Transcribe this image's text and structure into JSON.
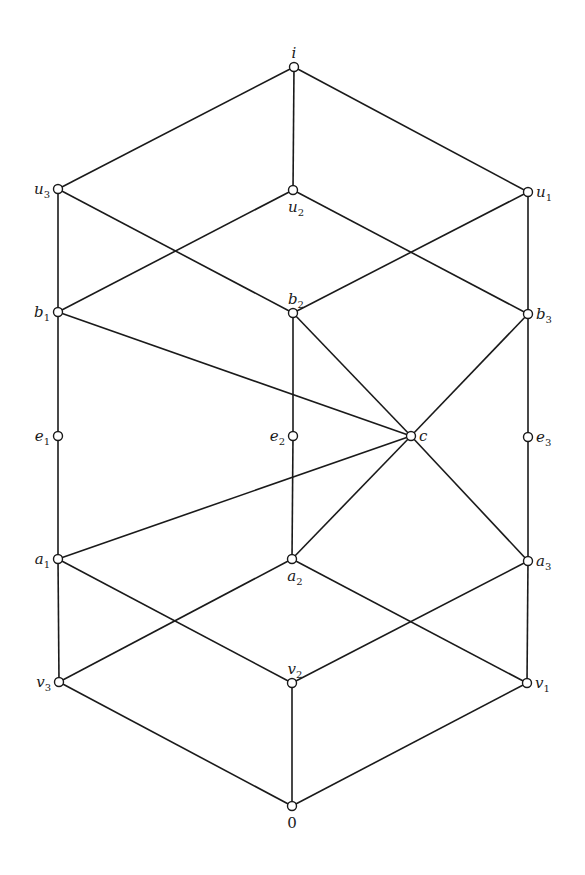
{
  "diagram": {
    "type": "hasse-diagram",
    "style": {
      "line_color": "#1a1a1a",
      "node_fill": "#ffffff",
      "background": "#ffffff"
    },
    "nodes": [
      {
        "id": "i",
        "base": "i",
        "sub": "",
        "x": 294,
        "y": 67,
        "label_pos": "above"
      },
      {
        "id": "u3",
        "base": "u",
        "sub": "3",
        "x": 58,
        "y": 189,
        "label_pos": "left"
      },
      {
        "id": "u2",
        "base": "u",
        "sub": "2",
        "x": 293,
        "y": 190,
        "label_pos": "below"
      },
      {
        "id": "u1",
        "base": "u",
        "sub": "1",
        "x": 528,
        "y": 192,
        "label_pos": "right"
      },
      {
        "id": "b1",
        "base": "b",
        "sub": "1",
        "x": 58,
        "y": 312,
        "label_pos": "left"
      },
      {
        "id": "b2",
        "base": "b",
        "sub": "2",
        "x": 293,
        "y": 313,
        "label_pos": "above"
      },
      {
        "id": "b3",
        "base": "b",
        "sub": "3",
        "x": 528,
        "y": 314,
        "label_pos": "right"
      },
      {
        "id": "e1",
        "base": "e",
        "sub": "1",
        "x": 58,
        "y": 436,
        "label_pos": "left"
      },
      {
        "id": "e2",
        "base": "e",
        "sub": "2",
        "x": 293,
        "y": 436,
        "label_pos": "left"
      },
      {
        "id": "c",
        "base": "c",
        "sub": "",
        "x": 411,
        "y": 436,
        "label_pos": "right"
      },
      {
        "id": "e3",
        "base": "e",
        "sub": "3",
        "x": 528,
        "y": 437,
        "label_pos": "right"
      },
      {
        "id": "a1",
        "base": "a",
        "sub": "1",
        "x": 58,
        "y": 559,
        "label_pos": "left"
      },
      {
        "id": "a2",
        "base": "a",
        "sub": "2",
        "x": 292,
        "y": 559,
        "label_pos": "below"
      },
      {
        "id": "a3",
        "base": "a",
        "sub": "3",
        "x": 528,
        "y": 561,
        "label_pos": "right"
      },
      {
        "id": "v3",
        "base": "v",
        "sub": "3",
        "x": 59,
        "y": 682,
        "label_pos": "left"
      },
      {
        "id": "v2",
        "base": "v",
        "sub": "2",
        "x": 292,
        "y": 683,
        "label_pos": "above"
      },
      {
        "id": "v1",
        "base": "v",
        "sub": "1",
        "x": 527,
        "y": 683,
        "label_pos": "right"
      },
      {
        "id": "0",
        "base": "0",
        "sub": "",
        "x": 292,
        "y": 806,
        "label_pos": "below",
        "upright": true
      }
    ],
    "edges": [
      [
        "i",
        "u3"
      ],
      [
        "i",
        "u2"
      ],
      [
        "i",
        "u1"
      ],
      [
        "u3",
        "b1"
      ],
      [
        "u3",
        "b2"
      ],
      [
        "u2",
        "b1"
      ],
      [
        "u2",
        "b3"
      ],
      [
        "u1",
        "b2"
      ],
      [
        "u1",
        "b3"
      ],
      [
        "b1",
        "e1"
      ],
      [
        "b1",
        "c"
      ],
      [
        "b2",
        "e2"
      ],
      [
        "b2",
        "c"
      ],
      [
        "b3",
        "e3"
      ],
      [
        "b3",
        "c"
      ],
      [
        "e1",
        "a1"
      ],
      [
        "e2",
        "a2"
      ],
      [
        "e3",
        "a3"
      ],
      [
        "c",
        "a1"
      ],
      [
        "c",
        "a2"
      ],
      [
        "c",
        "a3"
      ],
      [
        "a1",
        "v3"
      ],
      [
        "a1",
        "v2"
      ],
      [
        "a2",
        "v3"
      ],
      [
        "a2",
        "v1"
      ],
      [
        "a3",
        "v2"
      ],
      [
        "a3",
        "v1"
      ],
      [
        "v3",
        "0"
      ],
      [
        "v2",
        "0"
      ],
      [
        "v1",
        "0"
      ]
    ]
  }
}
